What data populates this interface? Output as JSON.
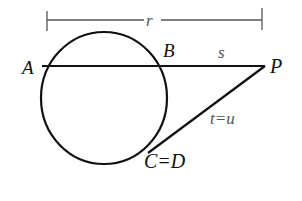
{
  "diagram": {
    "type": "secant-tangent circle diagram",
    "labels": {
      "point_a": "A",
      "point_b": "B",
      "point_p": "P",
      "point_cd": "C=D",
      "measure_r": "r",
      "measure_s": "s",
      "measure_tu": "t=u"
    },
    "colors": {
      "stroke": "#111111",
      "dimension_line": "#555555",
      "background": "#ffffff"
    }
  }
}
